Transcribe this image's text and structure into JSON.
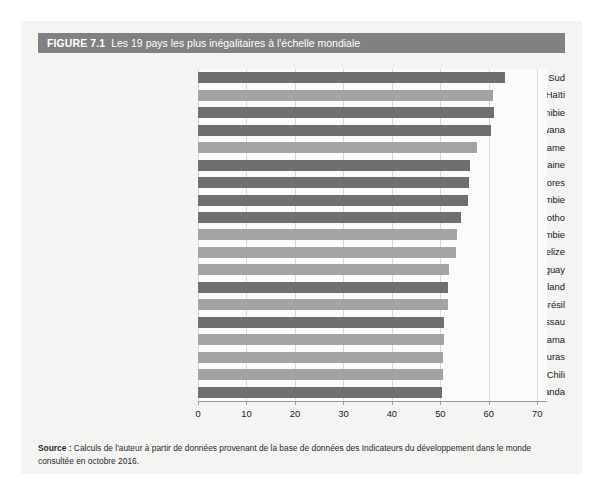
{
  "figure": {
    "number_label": "FIGURE 7.1",
    "title": "Les 19 pays les plus inégalitaires à l'échelle mondiale",
    "header_bg": "#818181",
    "panel_bg": "#f4f4f2"
  },
  "source": {
    "label": "Source :",
    "text": " Calculs de l'auteur à partir de données provenant de la base de données des Indicateurs du développement dans le monde consultée en octobre 2016."
  },
  "chart_data": {
    "type": "bar",
    "orientation": "horizontal",
    "title": "Les 19 pays les plus inégalitaires à l'échelle mondiale",
    "xlabel": "",
    "ylabel": "",
    "xlim": [
      0,
      72
    ],
    "xticks": [
      0,
      10,
      20,
      30,
      40,
      50,
      60,
      70
    ],
    "xtick_labels": [
      "0",
      "10",
      "20",
      "30",
      "40",
      "50",
      "60",
      "70"
    ],
    "grid": true,
    "grid_axis": "x",
    "legend": false,
    "bar_colors": {
      "dark": "#6f6f6f",
      "light": "#a3a3a3"
    },
    "categories": [
      "Afrique du Sud",
      "Haïti",
      "Namibie",
      "Botswana",
      "Suriname",
      "République centrafricaine",
      "Comores",
      "Zambie",
      "Lesotho",
      "Colombie",
      "Belize",
      "Paraguay",
      "Swaziland",
      "Brésil",
      "Guinée Bissau",
      "Panama",
      "Honduras",
      "Chili",
      "Rwanda"
    ],
    "values": [
      63.4,
      60.8,
      61.0,
      60.5,
      57.6,
      56.2,
      55.9,
      55.6,
      54.2,
      53.5,
      53.3,
      51.7,
      51.5,
      51.5,
      50.7,
      50.7,
      50.6,
      50.5,
      50.4
    ],
    "shades": [
      "dark",
      "light",
      "dark",
      "dark",
      "light",
      "dark",
      "dark",
      "dark",
      "dark",
      "light",
      "light",
      "light",
      "dark",
      "light",
      "dark",
      "light",
      "light",
      "light",
      "dark"
    ]
  }
}
